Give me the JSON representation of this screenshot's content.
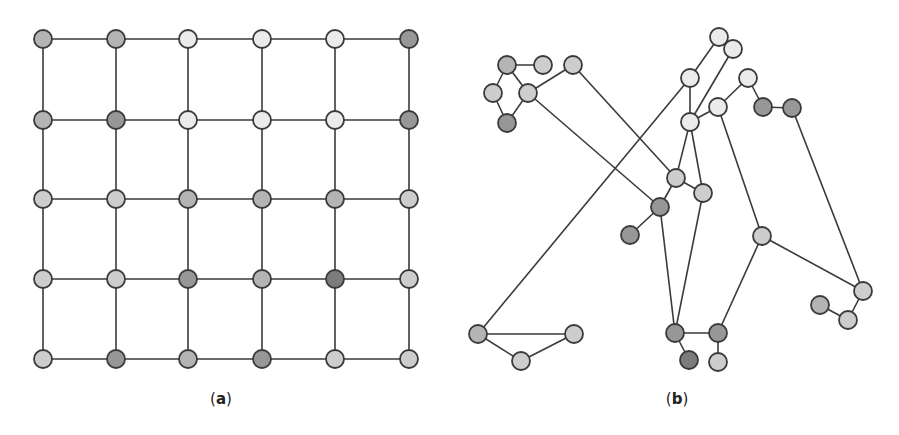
{
  "figure": {
    "palette": {
      "L": "#ebebeb",
      "ML": "#cdcdcd",
      "M": "#b4b4b4",
      "D": "#979797",
      "DD": "#7c7c7c"
    },
    "panel_a": {
      "label_open": "(",
      "label_letter": "a",
      "label_close": ")",
      "label_pos": [
        221,
        400
      ],
      "grid_x": [
        43,
        116,
        188,
        262,
        335,
        409
      ],
      "grid_y": [
        39,
        120,
        199,
        279,
        359
      ],
      "node_shades": [
        [
          "M",
          "M",
          "L",
          "L",
          "L",
          "D"
        ],
        [
          "M",
          "D",
          "L",
          "L",
          "L",
          "D"
        ],
        [
          "ML",
          "ML",
          "M",
          "M",
          "M",
          "ML"
        ],
        [
          "ML",
          "ML",
          "D",
          "M",
          "DD",
          "ML"
        ],
        [
          "ML",
          "D",
          "M",
          "D",
          "ML",
          "ML"
        ]
      ]
    },
    "panel_b": {
      "label_open": "(",
      "label_letter": "b",
      "label_close": ")",
      "label_pos": [
        677,
        400
      ],
      "nodes": {
        "A": [
          507,
          65,
          "M"
        ],
        "B": [
          543,
          65,
          "ML"
        ],
        "C": [
          573,
          65,
          "ML"
        ],
        "D": [
          493,
          93,
          "ML"
        ],
        "E": [
          528,
          93,
          "ML"
        ],
        "F": [
          507,
          123,
          "D"
        ],
        "G": [
          690,
          78,
          "L"
        ],
        "H": [
          690,
          122,
          "L"
        ],
        "I": [
          676,
          178,
          "ML"
        ],
        "J": [
          660,
          207,
          "D"
        ],
        "K": [
          630,
          235,
          "D"
        ],
        "L": [
          703,
          193,
          "ML"
        ],
        "M": [
          478,
          334,
          "M"
        ],
        "N": [
          574,
          334,
          "ML"
        ],
        "O": [
          675,
          333,
          "D"
        ],
        "P": [
          719,
          37,
          "L"
        ],
        "Q": [
          733,
          49,
          "L"
        ],
        "R": [
          748,
          78,
          "L"
        ],
        "S": [
          718,
          107,
          "L"
        ],
        "T": [
          763,
          107,
          "D"
        ],
        "U": [
          792,
          108,
          "D"
        ],
        "V": [
          762,
          236,
          "ML"
        ],
        "W": [
          863,
          291,
          "ML"
        ],
        "X": [
          820,
          305,
          "M"
        ],
        "Y": [
          848,
          320,
          "ML"
        ],
        "Z": [
          718,
          333,
          "D"
        ],
        "AA": [
          689,
          360,
          "DD"
        ],
        "AB": [
          718,
          362,
          "ML"
        ],
        "AC": [
          521,
          361,
          "ML"
        ]
      },
      "edges": [
        [
          "A",
          "B"
        ],
        [
          "A",
          "D"
        ],
        [
          "A",
          "E"
        ],
        [
          "D",
          "F"
        ],
        [
          "E",
          "F"
        ],
        [
          "E",
          "C"
        ],
        [
          "C",
          "I"
        ],
        [
          "E",
          "J"
        ],
        [
          "I",
          "J"
        ],
        [
          "J",
          "K"
        ],
        [
          "I",
          "L"
        ],
        [
          "I",
          "H"
        ],
        [
          "L",
          "H"
        ],
        [
          "J",
          "O"
        ],
        [
          "L",
          "O"
        ],
        [
          "M",
          "G"
        ],
        [
          "M",
          "N"
        ],
        [
          "M",
          "AC"
        ],
        [
          "AC",
          "N"
        ],
        [
          "P",
          "Q"
        ],
        [
          "P",
          "G"
        ],
        [
          "Q",
          "H"
        ],
        [
          "G",
          "H"
        ],
        [
          "H",
          "S"
        ],
        [
          "S",
          "R"
        ],
        [
          "R",
          "T"
        ],
        [
          "T",
          "U"
        ],
        [
          "S",
          "V"
        ],
        [
          "U",
          "W"
        ],
        [
          "V",
          "W"
        ],
        [
          "V",
          "Z"
        ],
        [
          "W",
          "Y"
        ],
        [
          "X",
          "Y"
        ],
        [
          "O",
          "Z"
        ],
        [
          "O",
          "AA"
        ],
        [
          "Z",
          "AB"
        ]
      ]
    },
    "node_radius": 9
  }
}
